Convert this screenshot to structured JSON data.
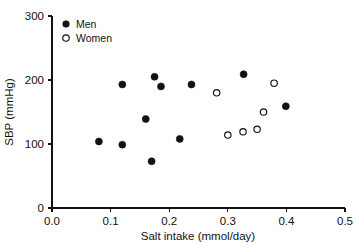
{
  "chart_data": {
    "type": "scatter",
    "title": "",
    "xlabel": "Salt intake (mmol/day)",
    "ylabel": "SBP (mmHg)",
    "xlim": [
      0.0,
      0.5
    ],
    "ylim": [
      0,
      300
    ],
    "xticks": [
      "0.0",
      "0.1",
      "0.2",
      "0.3",
      "0.4",
      "0.5"
    ],
    "xtick_values": [
      0.0,
      0.1,
      0.2,
      0.3,
      0.4,
      0.5
    ],
    "yticks": [
      "0",
      "100",
      "200",
      "300"
    ],
    "ytick_values": [
      0,
      100,
      200,
      300
    ],
    "grid": false,
    "legend_position": "top-left-inside",
    "series": [
      {
        "name": "Men",
        "marker": "filled-circle",
        "color": "#111111",
        "points": [
          {
            "x": 0.08,
            "y": 104
          },
          {
            "x": 0.12,
            "y": 193
          },
          {
            "x": 0.12,
            "y": 99
          },
          {
            "x": 0.16,
            "y": 139
          },
          {
            "x": 0.17,
            "y": 73
          },
          {
            "x": 0.175,
            "y": 205
          },
          {
            "x": 0.186,
            "y": 190
          },
          {
            "x": 0.218,
            "y": 108
          },
          {
            "x": 0.238,
            "y": 193
          },
          {
            "x": 0.327,
            "y": 209
          },
          {
            "x": 0.399,
            "y": 159
          }
        ]
      },
      {
        "name": "Women",
        "marker": "open-circle",
        "color": "#111111",
        "points": [
          {
            "x": 0.281,
            "y": 180
          },
          {
            "x": 0.3,
            "y": 114
          },
          {
            "x": 0.326,
            "y": 119
          },
          {
            "x": 0.35,
            "y": 123
          },
          {
            "x": 0.361,
            "y": 150
          },
          {
            "x": 0.379,
            "y": 195
          }
        ]
      }
    ]
  },
  "legend": {
    "items": [
      {
        "label": "Men",
        "marker": "filled-circle"
      },
      {
        "label": "Women",
        "marker": "open-circle"
      }
    ]
  },
  "axes": {
    "x_title": "Salt intake (mmol/day)",
    "y_title": "SBP (mmHg)"
  }
}
